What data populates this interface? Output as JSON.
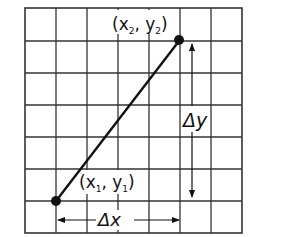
{
  "diagram": {
    "type": "slope-grid",
    "grid": {
      "columns": 7,
      "rows": 7,
      "line_color": "#333333",
      "background": "#ffffff"
    },
    "points": [
      {
        "id": "p1",
        "label_x": "x",
        "label_y": "y",
        "sub": "1",
        "grid_x": 1,
        "grid_y": 1
      },
      {
        "id": "p2",
        "label_x": "x",
        "label_y": "y",
        "sub": "2",
        "grid_x": 5,
        "grid_y": 6
      }
    ],
    "labels": {
      "p1_open": "(x",
      "p1_sub1": "1",
      "p1_mid": ", y",
      "p1_sub2": "1",
      "p1_close": ")",
      "p2_open": "(x",
      "p2_sub1": "2",
      "p2_mid": ", y",
      "p2_sub2": "2",
      "p2_close": ")",
      "delta_x": "Δx",
      "delta_y": "Δy"
    },
    "colors": {
      "line": "#111111",
      "point": "#111111"
    }
  }
}
